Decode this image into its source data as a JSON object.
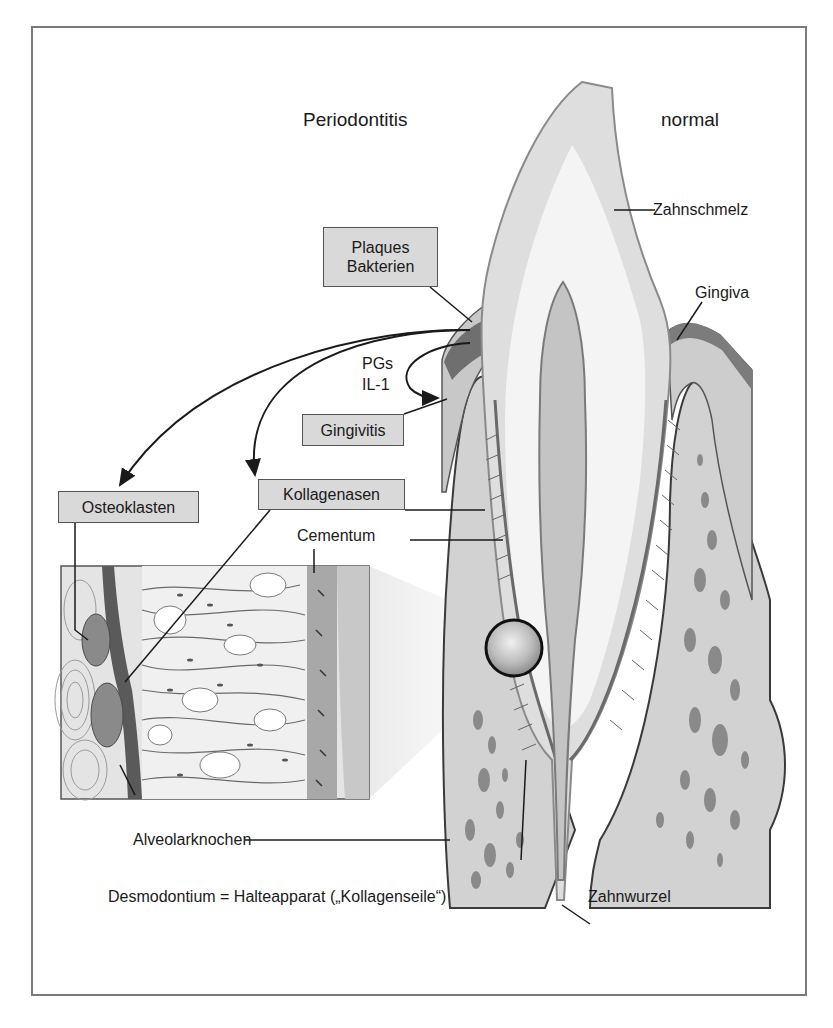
{
  "diagram": {
    "headings": {
      "left": "Periodontitis",
      "right": "normal"
    },
    "boxed_labels": {
      "plaques_line1": "Plaques",
      "plaques_line2": "Bakterien",
      "gingivitis": "Gingivitis",
      "osteoklasten": "Osteoklasten",
      "kollagenasen": "Kollagenasen"
    },
    "mediators": {
      "line1": "PGs",
      "line2": "IL-1"
    },
    "anatomy_labels": {
      "zahnschmelz": "Zahnschmelz",
      "gingiva": "Gingiva",
      "cementum": "Cementum",
      "alveolarknochen": "Alveolarknochen",
      "zahnwurzel": "Zahnwurzel",
      "desmodontium": "Desmodontium = Halteapparat („Kollagenseile“)"
    },
    "colors": {
      "frame": "#7a7a7a",
      "box_fill": "#d9d9d9",
      "enamel": "#e4e4e4",
      "dentin": "#f2f2f2",
      "bone": "#d2d2d2",
      "gingiva_dark": "#8c8c8c",
      "outline": "#4a4a4a"
    }
  }
}
